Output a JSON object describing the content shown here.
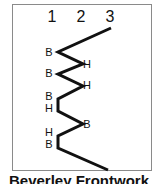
{
  "title": "Beverley Frontwork",
  "columns": [
    {
      "label": "1",
      "x": 52
    },
    {
      "label": "2",
      "x": 81
    },
    {
      "label": "3",
      "x": 110
    }
  ],
  "line_color": "#111111",
  "path_points": [
    [
      111,
      28
    ],
    [
      58,
      52
    ],
    [
      83,
      64
    ],
    [
      58,
      74
    ],
    [
      83,
      86
    ],
    [
      58,
      99
    ],
    [
      58,
      111
    ],
    [
      83,
      124
    ],
    [
      58,
      136
    ],
    [
      58,
      148
    ],
    [
      108,
      170
    ]
  ],
  "labels": [
    {
      "text": "B",
      "x": 49,
      "y": 56
    },
    {
      "text": "H",
      "x": 87,
      "y": 68
    },
    {
      "text": "B",
      "x": 49,
      "y": 77
    },
    {
      "text": "H",
      "x": 87,
      "y": 89
    },
    {
      "text": "B",
      "x": 49,
      "y": 100
    },
    {
      "text": "H",
      "x": 49,
      "y": 112
    },
    {
      "text": "B",
      "x": 87,
      "y": 128
    },
    {
      "text": "H",
      "x": 49,
      "y": 136
    },
    {
      "text": "B",
      "x": 49,
      "y": 148
    }
  ]
}
